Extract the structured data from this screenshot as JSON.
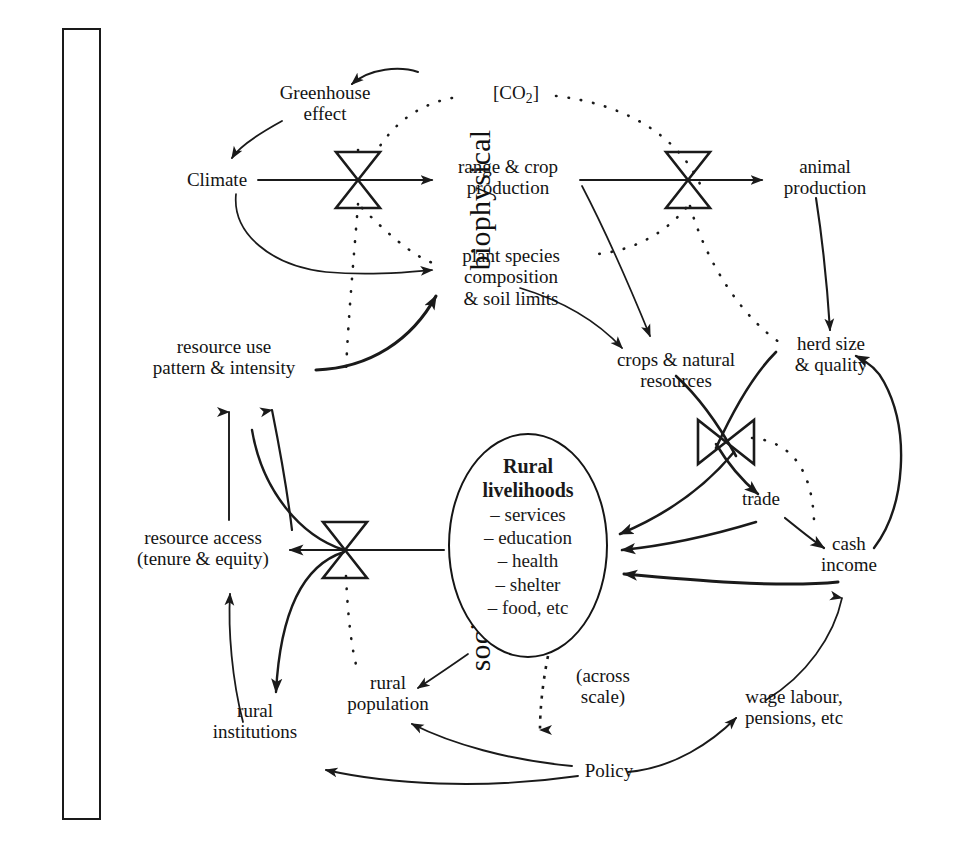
{
  "figure": {
    "axis_box": {
      "upper_label": "biophysical",
      "lower_label": "socioeconomic"
    },
    "center": {
      "title_line1": "Rural",
      "title_line2": "livelihoods",
      "items": [
        "– services",
        "– education",
        "– health",
        "– shelter",
        "– food, etc"
      ]
    },
    "nodes": [
      {
        "id": "greenhouse_effect",
        "label": "Greenhouse\neffect",
        "domain": "biophysical"
      },
      {
        "id": "co2",
        "label": "[CO2]",
        "domain": "biophysical"
      },
      {
        "id": "climate",
        "label": "Climate",
        "domain": "biophysical"
      },
      {
        "id": "range_crop",
        "label": "range & crop\nproduction",
        "domain": "biophysical"
      },
      {
        "id": "animal_production",
        "label": "animal\nproduction",
        "domain": "biophysical"
      },
      {
        "id": "plant_species",
        "label": "plant species\ncomposition\n& soil limits",
        "domain": "biophysical"
      },
      {
        "id": "resource_use",
        "label": "resource use\npattern & intensity",
        "domain": "biophysical"
      },
      {
        "id": "crops_natural",
        "label": "crops & natural\nresources",
        "domain": "biophysical"
      },
      {
        "id": "herd_size",
        "label": "herd size\n& quality",
        "domain": "biophysical"
      },
      {
        "id": "trade",
        "label": "trade",
        "domain": "socioeconomic"
      },
      {
        "id": "cash_income",
        "label": "cash\nincome",
        "domain": "socioeconomic"
      },
      {
        "id": "resource_access",
        "label": "resource access\n(tenure & equity)",
        "domain": "socioeconomic"
      },
      {
        "id": "rural_institutions",
        "label": "rural\ninstitutions",
        "domain": "socioeconomic"
      },
      {
        "id": "rural_population",
        "label": "rural\npopulation",
        "domain": "socioeconomic"
      },
      {
        "id": "policy",
        "label": "Policy",
        "domain": "socioeconomic"
      },
      {
        "id": "wage_labour",
        "label": "wage labour,\npensions, etc",
        "domain": "socioeconomic"
      },
      {
        "id": "across_scale",
        "label": "(across\nscale)",
        "domain": "socioeconomic"
      }
    ],
    "labels": {
      "greenhouse_effect_line1": "Greenhouse",
      "greenhouse_effect_line2": "effect",
      "co2_prefix": "[CO",
      "co2_sub": "2",
      "co2_suffix": "]",
      "climate": "Climate",
      "range_crop_line1": "range & crop",
      "range_crop_line2": "production",
      "animal_production_line1": "animal",
      "animal_production_line2": "production",
      "plant_species_line1": "plant species",
      "plant_species_line2": "composition",
      "plant_species_line3": "& soil limits",
      "resource_use_line1": "resource use",
      "resource_use_line2": "pattern & intensity",
      "crops_natural_line1": "crops & natural",
      "crops_natural_line2": "resources",
      "herd_size_line1": "herd size",
      "herd_size_line2": "& quality",
      "trade": "trade",
      "cash_income_line1": "cash",
      "cash_income_line2": "income",
      "resource_access_line1": "resource access",
      "resource_access_line2": "(tenure & equity)",
      "rural_institutions_line1": "rural",
      "rural_institutions_line2": "institutions",
      "rural_population_line1": "rural",
      "rural_population_line2": "population",
      "policy": "Policy",
      "wage_labour_line1": "wage labour,",
      "wage_labour_line2": "pensions, etc",
      "across_scale_line1": "(across",
      "across_scale_line2": "scale)"
    },
    "valves": [
      {
        "id": "valve-climate-range",
        "orientation": "vertical",
        "x": 358,
        "y": 180
      },
      {
        "id": "valve-range-animal",
        "orientation": "vertical",
        "x": 688,
        "y": 180
      },
      {
        "id": "valve-crops-trade",
        "orientation": "horizontal",
        "x": 725,
        "y": 440
      },
      {
        "id": "valve-resource-access",
        "orientation": "vertical",
        "x": 345,
        "y": 550
      }
    ],
    "link_styles": {
      "solid": "solid causal link",
      "dotted": "dotted feedback / indirect link"
    },
    "colors": {
      "ink": "#1a1a1a",
      "background": "#ffffff"
    }
  }
}
